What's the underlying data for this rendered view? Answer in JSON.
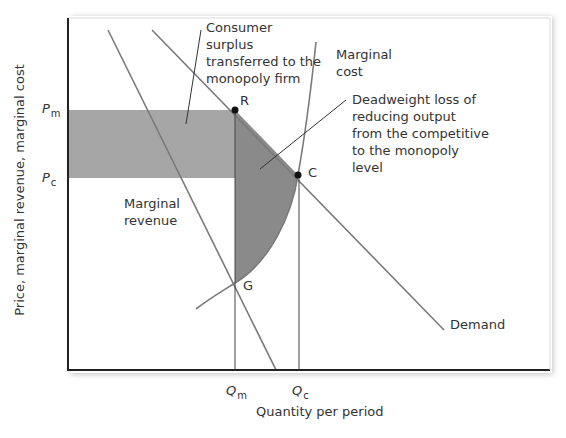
{
  "diagram": {
    "axes": {
      "y_label": "Price, marginal revenue, marginal cost",
      "x_label": "Quantity per period",
      "y_ticks": [
        {
          "main": "P",
          "sub": "m"
        },
        {
          "main": "P",
          "sub": "c"
        }
      ],
      "x_ticks": [
        {
          "main": "Q",
          "sub": "m"
        },
        {
          "main": "Q",
          "sub": "c"
        }
      ]
    },
    "points": {
      "R": "R",
      "C": "C",
      "G": "G"
    },
    "curves": {
      "demand": "Demand",
      "marginal_revenue_line1": "Marginal",
      "marginal_revenue_line2": "revenue",
      "marginal_cost_line1": "Marginal",
      "marginal_cost_line2": "cost"
    },
    "annotations": {
      "consumer_surplus": [
        "Consumer",
        "surplus",
        "transferred to the",
        "monopoly firm"
      ],
      "deadweight_loss": [
        "Deadweight loss of",
        "reducing output",
        "from the competitive",
        "to the monopoly",
        "level"
      ]
    },
    "colors": {
      "transfer_area": "#a6a6a6",
      "deadweight_area": "#8a8a8a",
      "curve": "#7a7a7a",
      "axis": "#222222",
      "text": "#333333"
    }
  }
}
